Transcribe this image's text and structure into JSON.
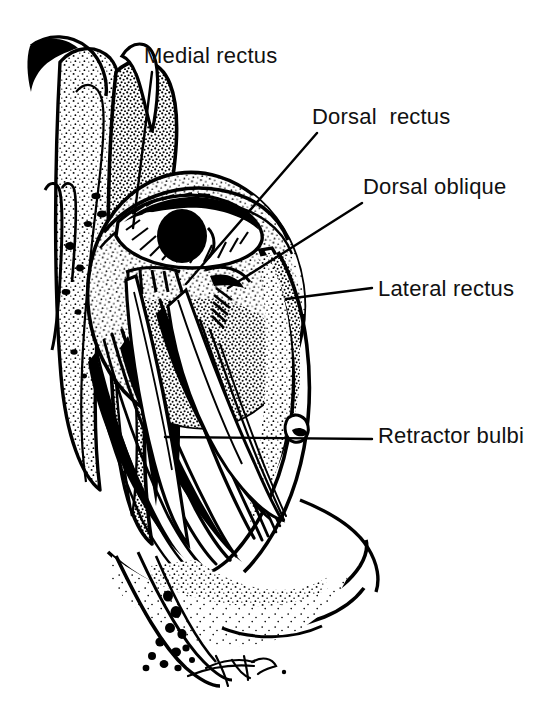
{
  "figure": {
    "kind": "anatomical-line-drawing",
    "background_color": "#ffffff",
    "ink_color": "#000000",
    "width": 547,
    "height": 712,
    "has_artist_signature": true
  },
  "labels": [
    {
      "id": "medial-rectus",
      "text": "Medial rectus",
      "text_x": 144,
      "text_y": 44,
      "leader": {
        "x1": 152,
        "y1": 72,
        "x2": 133,
        "y2": 228
      }
    },
    {
      "id": "dorsal-rectus",
      "text": "Dorsal  rectus",
      "text_x": 312,
      "text_y": 105,
      "leader": {
        "x1": 317,
        "y1": 133,
        "x2": 186,
        "y2": 284
      }
    },
    {
      "id": "dorsal-oblique",
      "text": "Dorsal oblique",
      "text_x": 363,
      "text_y": 175,
      "leader": {
        "x1": 362,
        "y1": 203,
        "x2": 228,
        "y2": 288
      }
    },
    {
      "id": "lateral-rectus",
      "text": "Lateral rectus",
      "text_x": 378,
      "text_y": 277,
      "leader": {
        "x1": 372,
        "y1": 288,
        "x2": 286,
        "y2": 299
      }
    },
    {
      "id": "retractor-bulbi",
      "text": "Retractor bulbi",
      "text_x": 378,
      "text_y": 424,
      "leader": {
        "x1": 372,
        "y1": 439,
        "x2": 165,
        "y2": 437
      }
    }
  ],
  "structures": [
    {
      "id": "eyeball",
      "name": "eyeball-globe"
    },
    {
      "id": "cornea-iris",
      "name": "iris-and-pupil"
    },
    {
      "id": "eyelid",
      "name": "eyelid-margin"
    },
    {
      "id": "orbital-bone",
      "name": "orbital-bone-upper"
    },
    {
      "id": "cartilage",
      "name": "nasal-cartilage"
    },
    {
      "id": "muscle-cone",
      "name": "muscle-cone-fibers"
    },
    {
      "id": "zygomatic-arch",
      "name": "zygomatic-arch"
    },
    {
      "id": "mandible",
      "name": "mandible-ramus"
    },
    {
      "id": "signature",
      "name": "artist-signature"
    }
  ]
}
